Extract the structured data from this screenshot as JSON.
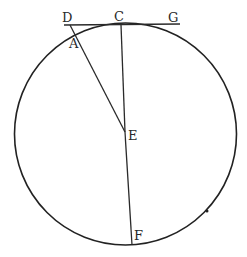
{
  "diagram": {
    "type": "geometry",
    "circle": {
      "cx": 125.5,
      "cy": 134,
      "r": 111,
      "stroke": "#222222"
    },
    "points": {
      "D": {
        "label": "D",
        "x": 68,
        "y": 25
      },
      "C": {
        "label": "C",
        "x": 121,
        "y": 24
      },
      "G": {
        "label": "G",
        "x": 178,
        "y": 25
      },
      "A": {
        "label": "A",
        "x": 76,
        "y": 37
      },
      "E": {
        "label": "E",
        "x": 125,
        "y": 132
      },
      "F": {
        "label": "F",
        "x": 132,
        "y": 244
      }
    },
    "labels": {
      "D": "D",
      "C": "C",
      "G": "G",
      "A": "A",
      "E": "E",
      "F": "F"
    },
    "segments": [
      {
        "from": "D",
        "to": "G",
        "description": "tangent line at C"
      },
      {
        "from": "D",
        "to": "E",
        "description": "line from D through A to center E"
      },
      {
        "from": "C",
        "to": "E",
        "description": "radius from C to center"
      },
      {
        "from": "E",
        "to": "F",
        "description": "radius from center to F"
      }
    ],
    "line_color": "#2a2a2a"
  }
}
